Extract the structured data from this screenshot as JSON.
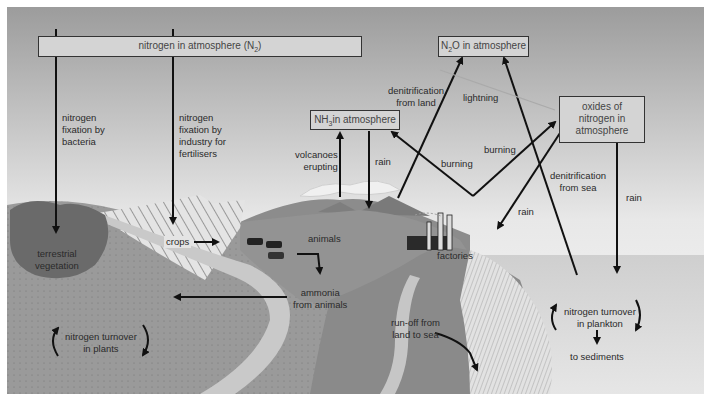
{
  "diagram": {
    "boxes": {
      "n2": {
        "label": "nitrogen in atmosphere (N",
        "sub": "2",
        "tail": ")"
      },
      "n2o": {
        "label": "N",
        "sub": "2",
        "tail": "O in atmosphere"
      },
      "nh3": {
        "label": "NH",
        "sub": "3",
        "tail": " in atmosphere"
      },
      "nox": {
        "line1": "oxides of",
        "line2": "nitrogen in",
        "line3": "atmosphere"
      }
    },
    "labels": {
      "fixation_bacteria": [
        "nitrogen",
        "fixation by",
        "bacteria"
      ],
      "fixation_industry": [
        "nitrogen",
        "fixation by",
        "industry for",
        "fertilisers"
      ],
      "volcanoes": [
        "volcanoes",
        "erupting"
      ],
      "rain_nh3": "rain",
      "denit_land": [
        "denitrification",
        "from land"
      ],
      "lightning": "lightning",
      "burning_left": "burning",
      "burning_right": "burning",
      "denit_sea": [
        "denitrification",
        "from sea"
      ],
      "rain_factory": "rain",
      "rain_sea": "rain",
      "terrestrial_veg": [
        "terrestrial",
        "vegetation"
      ],
      "crops": "crops",
      "animals": "animals",
      "ammonia": [
        "ammonia",
        "from animals"
      ],
      "factories": "factories",
      "turnover_plants": [
        "nitrogen turnover",
        "in plants"
      ],
      "runoff": [
        "run-off from",
        "land to sea"
      ],
      "turnover_plankton": [
        "nitrogen turnover",
        "in plankton"
      ],
      "sediments": "to sediments"
    },
    "colors": {
      "sky_top": "#9a9a9a",
      "sky_bottom": "#f4f4f4",
      "land": "#8e8e8e",
      "land_light": "#a8a8a8",
      "hill": "#858585",
      "sea": "#d0d0d0",
      "river": "#c8c8c8",
      "box_fill": "#d4d4d4",
      "arrow": "#111111"
    }
  }
}
